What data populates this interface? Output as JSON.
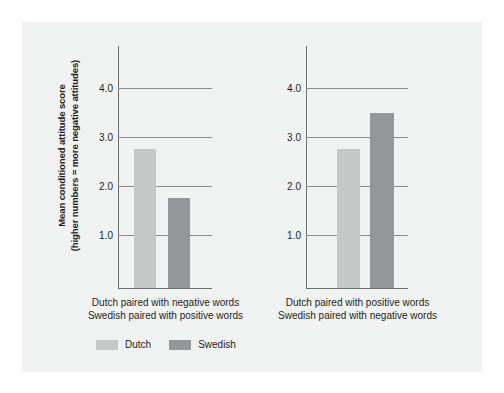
{
  "chart_data": {
    "type": "bar",
    "title": "",
    "xlabel": "",
    "ylabel": "Mean conditioned attitude score (higher numbers = more negative attitudes)",
    "ylabel_line1": "Mean conditioned attitude score",
    "ylabel_line2": "(higher numbers = more negative attitudes)",
    "ylim": [
      0,
      4.5
    ],
    "yticks": [
      "1.0",
      "2.0",
      "3.0",
      "4.0"
    ],
    "ytick_values": [
      1.0,
      2.0,
      3.0,
      4.0
    ],
    "grid": true,
    "legend_position": "bottom",
    "legend": [
      {
        "name": "Dutch",
        "color": "#c6c7c9"
      },
      {
        "name": "Swedish",
        "color": "#949699"
      }
    ],
    "panels": [
      {
        "category_line1": "Dutch paired with negative words",
        "category_line2": "Swedish paired with positive words",
        "bars": [
          {
            "series": "Dutch",
            "value": 2.73
          },
          {
            "series": "Swedish",
            "value": 1.74
          }
        ]
      },
      {
        "category_line1": "Dutch paired with positive words",
        "category_line2": "Swedish paired with negative words",
        "bars": [
          {
            "series": "Dutch",
            "value": 2.73
          },
          {
            "series": "Swedish",
            "value": 3.47
          }
        ]
      }
    ],
    "series": [
      {
        "name": "Dutch",
        "values": [
          2.73,
          2.73
        ],
        "color": "#c6c7c9"
      },
      {
        "name": "Swedish",
        "values": [
          1.74,
          3.47
        ],
        "color": "#949699"
      }
    ],
    "categories": [
      "Dutch paired with negative words / Swedish paired with positive words",
      "Dutch paired with positive words / Swedish paired with negative words"
    ]
  },
  "colors": {
    "background": "#ffffff",
    "panel": "#f1f2f2",
    "axis": "#6d6e71",
    "gridline": "#8a8c8e",
    "text": "#231f20",
    "dutch": "#c6c7c9",
    "swedish": "#949699"
  }
}
